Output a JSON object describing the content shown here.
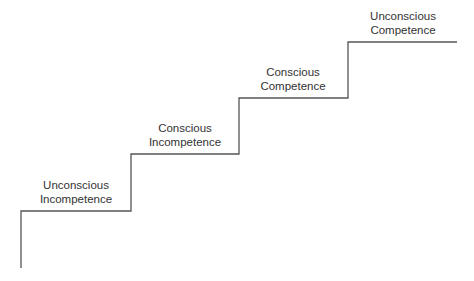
{
  "diagram": {
    "type": "staircase",
    "line_color": "#555555",
    "steps": [
      {
        "line1": "Unconscious",
        "line2": "Incompetence"
      },
      {
        "line1": "Conscious",
        "line2": "Incompetence"
      },
      {
        "line1": "Conscious",
        "line2": "Competence"
      },
      {
        "line1": "Unconscious",
        "line2": "Competence"
      }
    ]
  }
}
